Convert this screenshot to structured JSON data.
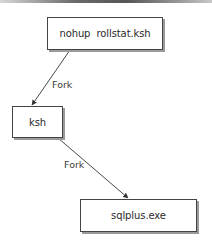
{
  "diagram": {
    "nodes": [
      {
        "id": "nohup",
        "label": "nohup  rollstat.ksh"
      },
      {
        "id": "ksh",
        "label": "ksh"
      },
      {
        "id": "sqlplus",
        "label": "sqlplus.exe"
      }
    ],
    "edges": [
      {
        "from": "nohup",
        "to": "ksh",
        "label": "Fork"
      },
      {
        "from": "ksh",
        "to": "sqlplus",
        "label": "Fork"
      }
    ]
  },
  "colors": {
    "border": "#444444",
    "shadow": "#9a9a9a",
    "text": "#2a2a2a",
    "arrow": "#333333"
  }
}
